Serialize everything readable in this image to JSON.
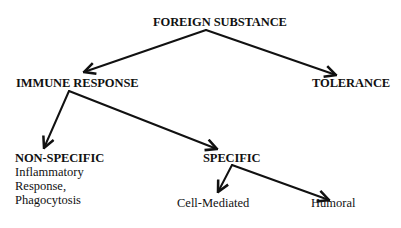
{
  "diagram": {
    "type": "tree",
    "nodes": {
      "root": {
        "label": "FOREIGN SUBSTANCE"
      },
      "immune_response": {
        "label": "IMMUNE RESPONSE"
      },
      "tolerance": {
        "label": "TOLERANCE"
      },
      "non_specific": {
        "label": "NON-SPECIFIC",
        "details": [
          "Inflammatory",
          "Response,",
          "Phagocytosis"
        ]
      },
      "specific": {
        "label": "SPECIFIC"
      },
      "cell_mediated": {
        "label": "Cell-Mediated"
      },
      "humoral": {
        "label": "Humoral"
      }
    },
    "edges": [
      {
        "from": "FOREIGN SUBSTANCE",
        "to": "IMMUNE RESPONSE"
      },
      {
        "from": "FOREIGN SUBSTANCE",
        "to": "TOLERANCE"
      },
      {
        "from": "IMMUNE RESPONSE",
        "to": "NON-SPECIFIC"
      },
      {
        "from": "IMMUNE RESPONSE",
        "to": "SPECIFIC"
      },
      {
        "from": "SPECIFIC",
        "to": "Cell-Mediated"
      },
      {
        "from": "SPECIFIC",
        "to": "Humoral"
      }
    ],
    "colors": {
      "line": "#111111",
      "text": "#111111",
      "background": "#ffffff"
    }
  }
}
